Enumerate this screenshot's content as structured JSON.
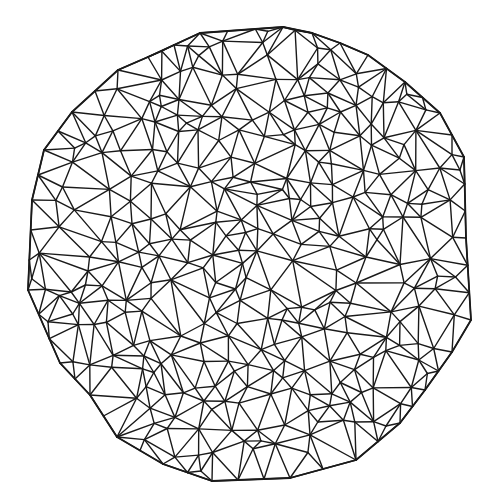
{
  "figure": {
    "description": "Delaunay-style triangular mesh filling a roughly circular region",
    "background": "#ffffff",
    "stroke_color": "#1a1a1a",
    "stroke_width": 1.4,
    "center": [
      248,
      255
    ],
    "radius": 225,
    "interior_point_count": 330,
    "seed": 12345,
    "hull": [
      [
        283,
        27
      ],
      [
        312,
        33
      ],
      [
        340,
        43
      ],
      [
        368,
        55
      ],
      [
        405,
        82
      ],
      [
        440,
        113
      ],
      [
        464,
        157
      ],
      [
        466,
        238
      ],
      [
        471,
        320
      ],
      [
        452,
        352
      ],
      [
        425,
        390
      ],
      [
        400,
        423
      ],
      [
        356,
        460
      ],
      [
        290,
        478
      ],
      [
        212,
        481
      ],
      [
        163,
        464
      ],
      [
        117,
        437
      ],
      [
        90,
        395
      ],
      [
        60,
        363
      ],
      [
        28,
        290
      ],
      [
        32,
        200
      ],
      [
        44,
        150
      ],
      [
        72,
        112
      ],
      [
        118,
        70
      ],
      [
        148,
        57
      ],
      [
        200,
        33
      ]
    ]
  }
}
